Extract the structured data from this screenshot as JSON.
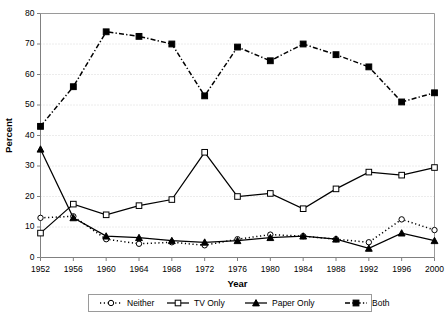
{
  "chart_data": {
    "type": "line",
    "title": "",
    "xlabel": "Year",
    "ylabel": "Percent",
    "x": [
      1952,
      1956,
      1960,
      1964,
      1968,
      1972,
      1976,
      1980,
      1984,
      1988,
      1992,
      1996,
      2000
    ],
    "categories": [
      "1952",
      "1956",
      "1960",
      "1964",
      "1968",
      "1972",
      "1976",
      "1980",
      "1984",
      "1988",
      "1992",
      "1996",
      "2000"
    ],
    "xlim": [
      1952,
      2000
    ],
    "ylim": [
      0,
      80
    ],
    "yticks": [
      0,
      10,
      20,
      30,
      40,
      50,
      60,
      70,
      80
    ],
    "xticks": [
      1952,
      1956,
      1960,
      1964,
      1968,
      1972,
      1976,
      1980,
      1984,
      1988,
      1992,
      1996,
      2000
    ],
    "grid": true,
    "legend_position": "bottom",
    "series": [
      {
        "name": "Neither",
        "marker": "open-circle",
        "linestyle": "dotted",
        "color": "#000000",
        "values": [
          13,
          13.5,
          6,
          4.5,
          5,
          4,
          6,
          7.5,
          7,
          6,
          5,
          12.5,
          9
        ]
      },
      {
        "name": "TV Only",
        "marker": "open-square",
        "linestyle": "solid",
        "color": "#000000",
        "values": [
          8,
          17.5,
          14,
          17,
          19,
          34.5,
          20,
          21,
          16,
          22.5,
          28,
          27,
          29.5
        ]
      },
      {
        "name": "Paper Only",
        "marker": "filled-triangle",
        "linestyle": "solid",
        "color": "#000000",
        "values": [
          35.5,
          13,
          7,
          6.5,
          5.5,
          5,
          5.5,
          6.5,
          7,
          6,
          3,
          8,
          5.5
        ]
      },
      {
        "name": "Both",
        "marker": "filled-square",
        "linestyle": "dash-dot",
        "color": "#000000",
        "values": [
          43,
          56,
          74,
          72.5,
          70,
          53,
          69,
          64.5,
          70,
          66.5,
          62.5,
          51,
          54
        ]
      }
    ]
  },
  "legend": {
    "entries": [
      {
        "label": "Neither"
      },
      {
        "label": "TV Only"
      },
      {
        "label": "Paper Only"
      },
      {
        "label": "Both"
      }
    ]
  }
}
